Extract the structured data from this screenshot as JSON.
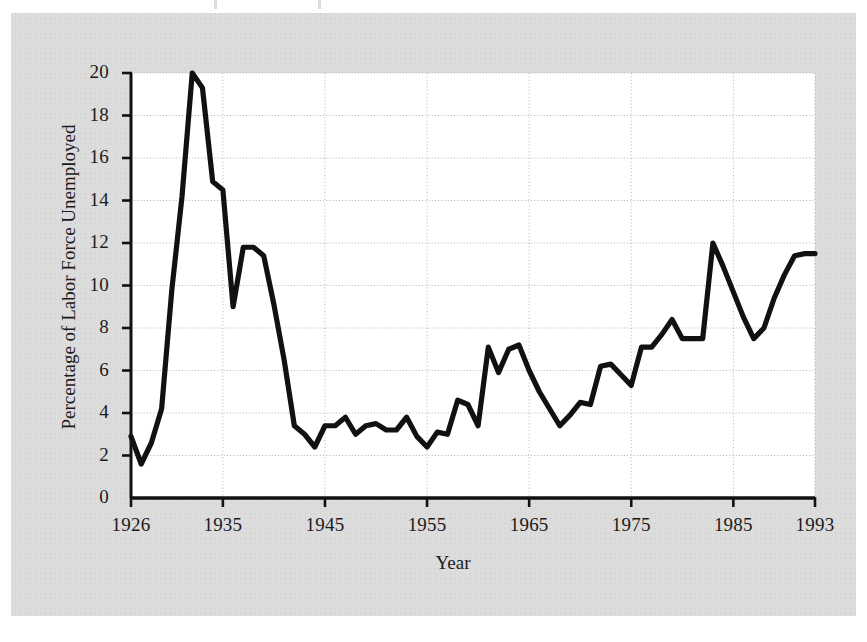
{
  "figure": {
    "background_color": "#ffffff",
    "mat_color": "#dcdcdc",
    "plot_background_color": "#ffffff",
    "line_color": "#111111",
    "grid_color": "#b4b4b4",
    "axis_color": "#111111"
  },
  "chart_data": {
    "type": "line",
    "title": "",
    "subtitle": "",
    "xlabel": "Year",
    "ylabel": "Percentage of Labor Force Unemployed",
    "xlim": [
      1926,
      1993
    ],
    "ylim": [
      0,
      20
    ],
    "grid": true,
    "legend": false,
    "legend_position": "none",
    "x_tick_labels": [
      "1926",
      "1935",
      "1945",
      "1955",
      "1965",
      "1975",
      "1985",
      "1993"
    ],
    "x_ticks": [
      1926,
      1935,
      1945,
      1955,
      1965,
      1975,
      1985,
      1993
    ],
    "y_tick_labels": [
      "0",
      "2",
      "4",
      "6",
      "8",
      "10",
      "12",
      "14",
      "16",
      "18",
      "20"
    ],
    "y_ticks": [
      0,
      2,
      4,
      6,
      8,
      10,
      12,
      14,
      16,
      18,
      20
    ],
    "series": [
      {
        "name": "Percentage of Labor Force Unemployed",
        "x": [
          1926,
          1927,
          1928,
          1929,
          1930,
          1931,
          1932,
          1933,
          1934,
          1935,
          1936,
          1937,
          1938,
          1939,
          1940,
          1941,
          1942,
          1943,
          1944,
          1945,
          1946,
          1947,
          1948,
          1949,
          1950,
          1951,
          1952,
          1953,
          1954,
          1955,
          1956,
          1957,
          1958,
          1959,
          1960,
          1961,
          1962,
          1963,
          1964,
          1965,
          1966,
          1967,
          1968,
          1969,
          1970,
          1971,
          1972,
          1973,
          1974,
          1975,
          1976,
          1977,
          1978,
          1979,
          1980,
          1981,
          1982,
          1983,
          1984,
          1985,
          1986,
          1987,
          1988,
          1989,
          1990,
          1991,
          1992,
          1993
        ],
        "values": [
          2.9,
          1.6,
          2.6,
          4.2,
          9.8,
          14.2,
          20.0,
          19.3,
          14.9,
          14.5,
          9.0,
          11.8,
          11.8,
          11.4,
          9.1,
          6.5,
          3.4,
          3.0,
          2.4,
          3.4,
          3.4,
          3.8,
          3.0,
          3.4,
          3.5,
          3.2,
          3.2,
          3.8,
          2.9,
          2.4,
          3.1,
          3.0,
          4.6,
          4.4,
          3.4,
          7.1,
          5.9,
          7.0,
          7.2,
          6.0,
          5.0,
          4.2,
          3.4,
          3.9,
          4.5,
          4.4,
          6.2,
          6.3,
          5.8,
          5.3,
          7.1,
          7.1,
          7.7,
          8.4,
          7.5,
          7.5,
          7.5,
          12.0,
          10.9,
          9.7,
          8.5,
          7.5,
          8.0,
          9.4,
          10.5,
          11.4,
          11.5,
          11.5
        ]
      }
    ],
    "annotations": []
  },
  "axes": {
    "y_label": "Percentage of Labor Force Unemployed",
    "x_label": "Year",
    "y_ticks": [
      {
        "value": 20,
        "label": "20"
      },
      {
        "value": 18,
        "label": "18"
      },
      {
        "value": 16,
        "label": "16"
      },
      {
        "value": 14,
        "label": "14"
      },
      {
        "value": 12,
        "label": "12"
      },
      {
        "value": 10,
        "label": "10"
      },
      {
        "value": 8,
        "label": "8"
      },
      {
        "value": 6,
        "label": "6"
      },
      {
        "value": 4,
        "label": "4"
      },
      {
        "value": 2,
        "label": "2"
      },
      {
        "value": 0,
        "label": "0"
      }
    ],
    "x_ticks": [
      {
        "value": 1926,
        "label": "1926"
      },
      {
        "value": 1935,
        "label": "1935"
      },
      {
        "value": 1945,
        "label": "1945"
      },
      {
        "value": 1955,
        "label": "1955"
      },
      {
        "value": 1965,
        "label": "1965"
      },
      {
        "value": 1975,
        "label": "1975"
      },
      {
        "value": 1985,
        "label": "1985"
      },
      {
        "value": 1993,
        "label": "1993"
      }
    ]
  }
}
